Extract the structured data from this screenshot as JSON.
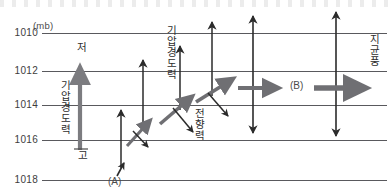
{
  "figure": {
    "kind": "meteorology-force-balance-diagram",
    "axis_unit": "(mb)",
    "y_ticks": [
      {
        "label": "1010",
        "value": 1010,
        "y": 33
      },
      {
        "label": "1012",
        "value": 1012,
        "y": 71
      },
      {
        "label": "1014",
        "value": 1014,
        "y": 105
      },
      {
        "label": "1016",
        "value": 1016,
        "y": 140
      },
      {
        "label": "1018",
        "value": 1018,
        "y": 180
      }
    ],
    "isobar_color": "#59595d",
    "pressure_low_label": "저",
    "pressure_high_label": "고",
    "labels": {
      "pgf_left": "기압경도력",
      "pgf_mid": "기압경도력",
      "coriolis": "전향력",
      "geostrophic_wind": "지균풍",
      "point_a": "(A)",
      "point_b": "(B)"
    },
    "colors": {
      "pgf_arrow": "#7c7c80",
      "wind_arrow": "#6f6f73",
      "coriolis_arrow": "#2b2b2b",
      "thin_arrow": "#2b2b2b",
      "isobar": "#59595d",
      "text": "#2e2e2e"
    },
    "stages": [
      {
        "name": "stage-1-rest",
        "point": "(A)",
        "x": 120,
        "note": "air parcel starts at rest, pressure gradient force only"
      },
      {
        "name": "stage-2-accelerating",
        "x": 160,
        "note": "wind begins, Coriolis force deflects"
      },
      {
        "name": "stage-3-balanced",
        "point": "(B)",
        "x": 265,
        "note": "geostrophic balance reached"
      },
      {
        "name": "stage-4-geostrophic",
        "x": 340,
        "note": "geostrophic wind parallel to isobars"
      }
    ]
  }
}
